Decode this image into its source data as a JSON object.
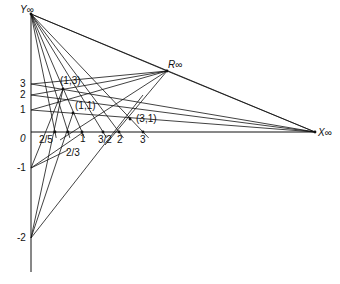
{
  "diagram": {
    "points_at_infinity": {
      "y_inf": {
        "label": "Y∞",
        "x": 31,
        "y": 14
      },
      "x_inf": {
        "label": "X∞",
        "x": 315,
        "y": 132
      },
      "r_inf": {
        "label": "R∞",
        "x": 167,
        "y": 71
      }
    },
    "origin": {
      "label": "0",
      "x": 31,
      "y": 132
    },
    "x_axis_ticks": [
      {
        "label": "2/5",
        "x": 55
      },
      {
        "label": "2/3",
        "x": 68
      },
      {
        "label": "1",
        "x": 82
      },
      {
        "label": "3/2",
        "x": 103
      },
      {
        "label": "2",
        "x": 119
      },
      {
        "label": "3",
        "x": 143
      }
    ],
    "y_axis_ticks": [
      {
        "label": "3",
        "y": 84
      },
      {
        "label": "2",
        "y": 95
      },
      {
        "label": "1",
        "y": 110
      },
      {
        "label": "-1",
        "y": 168
      },
      {
        "label": "-2",
        "y": 238
      }
    ],
    "labeled_points": [
      {
        "label": "(1,3)",
        "x": 63,
        "y": 89
      },
      {
        "label": "(1,1)",
        "x": 73,
        "y": 113
      },
      {
        "label": "(3,1)",
        "x": 130,
        "y": 119
      }
    ],
    "line_color": "#111111"
  }
}
